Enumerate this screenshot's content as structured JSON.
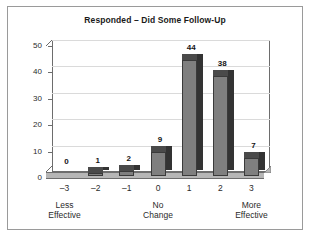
{
  "chart_data": {
    "type": "bar",
    "title": "Responded – Did Some Follow-Up",
    "xlabel": "",
    "ylabel": "",
    "categories": [
      "–3",
      "–2",
      "–1",
      "0",
      "1",
      "2",
      "3"
    ],
    "values": [
      0,
      1,
      2,
      9,
      44,
      38,
      7
    ],
    "ylim": [
      0,
      50
    ],
    "yticks": [
      0,
      10,
      20,
      30,
      40,
      50
    ],
    "ytick_labels": [
      "0",
      "10",
      "20",
      "30",
      "40",
      "50"
    ],
    "grid": true,
    "legend": "none",
    "data_labels": [
      "0",
      "1",
      "2",
      "9",
      "44",
      "38",
      "7"
    ],
    "group_labels": [
      {
        "line1": "Less",
        "line2": "Effective",
        "at_category": "–3"
      },
      {
        "line1": "No",
        "line2": "Change",
        "at_category": "0"
      },
      {
        "line1": "More",
        "line2": "Effective",
        "at_category": "3"
      }
    ],
    "style": {
      "bar_face_color": "#7f7f7f",
      "bar_side_color": "#333333",
      "bar_top_color": "#4a4a4a",
      "bar_edge_color": "#3a3a3a",
      "grid_color": "#dadada",
      "axis_color": "#6d6d6d",
      "floor_color": "#b6b6b6",
      "background_color": "#ffffff",
      "border_color": "#9a9a9a",
      "text_color": "#2b2b2b"
    }
  }
}
